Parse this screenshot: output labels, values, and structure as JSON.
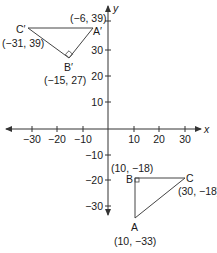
{
  "diagram": {
    "type": "coordinate-plane-reflection",
    "axes": {
      "x_label": "x",
      "y_label": "y",
      "x_ticks": [
        {
          "value": -30,
          "label": "−30"
        },
        {
          "value": -20,
          "label": "−20"
        },
        {
          "value": -10,
          "label": "−10"
        },
        {
          "value": 10,
          "label": "10"
        },
        {
          "value": 20,
          "label": "20"
        },
        {
          "value": 30,
          "label": "30"
        }
      ],
      "y_ticks": [
        {
          "value": 30,
          "label": "30"
        },
        {
          "value": 20,
          "label": "20"
        },
        {
          "value": 10,
          "label": "10"
        },
        {
          "value": -10,
          "label": "−10"
        },
        {
          "value": -20,
          "label": "−20"
        },
        {
          "value": -30,
          "label": "−30"
        }
      ]
    },
    "triangles": [
      {
        "name": "ABC",
        "vertices": [
          {
            "name": "A",
            "coord_label": "(10, −33)",
            "x": 10,
            "y": -33
          },
          {
            "name": "B",
            "coord_label": "(10, −18)",
            "x": 10,
            "y": -18,
            "right_angle": true
          },
          {
            "name": "C",
            "coord_label": "(30, −18)",
            "x": 30,
            "y": -18
          }
        ]
      },
      {
        "name": "A'B'C'",
        "vertices": [
          {
            "name": "A′",
            "coord_label": "(−6, 39)",
            "x": -6,
            "y": 39
          },
          {
            "name": "B′",
            "coord_label": "(−15, 27)",
            "x": -15,
            "y": 27,
            "right_angle": true
          },
          {
            "name": "C′",
            "coord_label": "(−31, 39)",
            "x": -31,
            "y": 39
          }
        ]
      }
    ],
    "colors": {
      "axis": "#333333",
      "triangle": "#444444",
      "text": "#1a1a1a",
      "background": "#ffffff"
    }
  }
}
